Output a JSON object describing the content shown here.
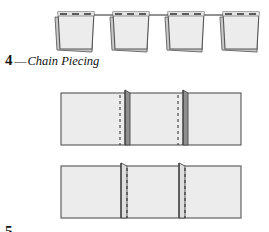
{
  "figure": {
    "background_color": "#ffffff",
    "ink_color": "#111111",
    "fabric_fill": "#ececec",
    "fabric_fill_light": "#f2f2f2",
    "fabric_edge": "#555555",
    "fabric_shadow": "#9a9a9a",
    "fabric_dark": "#5c5c5c",
    "thread_color": "#4a4a4a",
    "stitch_color": "#3a3a3a"
  },
  "captions": {
    "top": {
      "number": "4",
      "dash": "—",
      "text": "Chain Piecing"
    },
    "bottom": {
      "number": "5",
      "dash": "",
      "text": ""
    }
  },
  "rows": {
    "row1": {
      "name": "chained-patch-units",
      "description": "Four stitched patch units connected by a continuous chain thread",
      "unit_count": 4,
      "units": [
        {
          "index": 1,
          "x": 57,
          "y": 12,
          "width": 38,
          "height": 37
        },
        {
          "index": 2,
          "x": 112,
          "y": 12,
          "width": 38,
          "height": 37
        },
        {
          "index": 3,
          "x": 167,
          "y": 12,
          "width": 38,
          "height": 37
        },
        {
          "index": 4,
          "x": 222,
          "y": 12,
          "width": 38,
          "height": 37
        }
      ],
      "thread_y": 15,
      "stitch_dashes_per_unit": 3
    },
    "row2": {
      "name": "joined-strip-seams-closed",
      "description": "Joined fabric strip with two seam allowances standing closed, dashed stitching lines",
      "x": 61,
      "y": 93,
      "width": 180,
      "height": 52,
      "seam_positions": [
        128,
        186
      ],
      "seam_count": 2
    },
    "row3": {
      "name": "joined-strip-seams-pressed",
      "description": "Joined fabric strip with two seam allowances pressed open, dashed stitching lines",
      "x": 61,
      "y": 166,
      "width": 180,
      "height": 52,
      "seam_positions": [
        128,
        186
      ],
      "seam_count": 2
    }
  }
}
